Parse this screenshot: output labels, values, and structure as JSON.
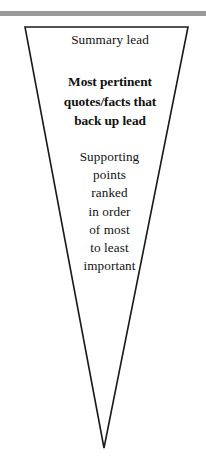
{
  "figure": {
    "name": "inverted-pyramid-diagram",
    "shape": "inverted-triangle",
    "outline_color": "#1a1a1a",
    "fill_color": "#ffffff",
    "rule_color": "#9a9a9a",
    "text_color": "#111111"
  },
  "top_rule": {
    "label": "horizontal-rule"
  },
  "tiers": [
    {
      "id": "summary-lead",
      "label": "Summary lead",
      "weight": "regular",
      "lines": [
        "Summary lead"
      ]
    },
    {
      "id": "supporting-quotes",
      "label": "Most pertinent quotes/facts that back up lead",
      "weight": "bold",
      "lines": [
        "Most pertinent",
        "quotes/facts that",
        "back up lead"
      ]
    },
    {
      "id": "supporting-points",
      "label": "Supporting points ranked in order of most to least important",
      "weight": "regular",
      "lines": [
        "Supporting",
        "points",
        "ranked",
        "in order",
        "of most",
        "to least",
        "important"
      ]
    }
  ],
  "geometry": {
    "apex_x": 104,
    "apex_y": 448,
    "top_left_x": 25,
    "top_right_x": 188,
    "top_y": 27
  }
}
